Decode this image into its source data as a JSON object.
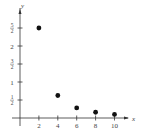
{
  "chart_data": {
    "type": "scatter",
    "title": "",
    "xlabel": "x",
    "ylabel": "y",
    "x_ticks": [
      "2",
      "4",
      "6",
      "8",
      "10"
    ],
    "y_ticks": [
      "1/2",
      "1",
      "3/2",
      "2",
      "5/2"
    ],
    "xlim": [
      0,
      11
    ],
    "ylim": [
      0,
      2.8
    ],
    "grid": false,
    "legend": null,
    "points": [
      {
        "x": 2,
        "y": 2.5
      },
      {
        "x": 4,
        "y": 0.625
      },
      {
        "x": 6,
        "y": 0.28
      },
      {
        "x": 8,
        "y": 0.16
      },
      {
        "x": 10,
        "y": 0.1
      }
    ],
    "point_color": "#111111"
  }
}
